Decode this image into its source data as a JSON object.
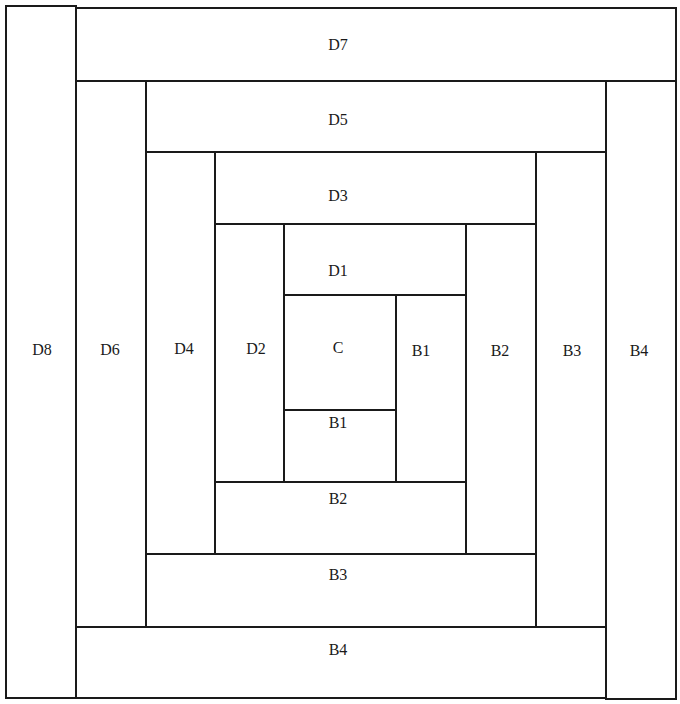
{
  "diagram": {
    "pieces": [
      {
        "id": "D8",
        "label": "D8",
        "x": 5,
        "y": 5,
        "w": 72,
        "h": 694,
        "lx": 42,
        "ly": 350
      },
      {
        "id": "D7",
        "label": "D7",
        "x": 75,
        "y": 7,
        "w": 602,
        "h": 75,
        "lx": 338,
        "ly": 45
      },
      {
        "id": "D6",
        "label": "D6",
        "x": 75,
        "y": 80,
        "w": 72,
        "h": 548,
        "lx": 110,
        "ly": 350
      },
      {
        "id": "D5",
        "label": "D5",
        "x": 145,
        "y": 80,
        "w": 462,
        "h": 73,
        "lx": 338,
        "ly": 120
      },
      {
        "id": "B4-right",
        "label": "B4",
        "x": 605,
        "y": 80,
        "w": 72,
        "h": 620,
        "lx": 639,
        "ly": 351
      },
      {
        "id": "D4",
        "label": "D4",
        "x": 145,
        "y": 151,
        "w": 71,
        "h": 404,
        "lx": 184,
        "ly": 349
      },
      {
        "id": "D3",
        "label": "D3",
        "x": 214,
        "y": 151,
        "w": 323,
        "h": 74,
        "lx": 338,
        "ly": 196
      },
      {
        "id": "B3-right",
        "label": "B3",
        "x": 535,
        "y": 151,
        "w": 72,
        "h": 477,
        "lx": 572,
        "ly": 351
      },
      {
        "id": "D2",
        "label": "D2",
        "x": 214,
        "y": 223,
        "w": 71,
        "h": 260,
        "lx": 256,
        "ly": 349
      },
      {
        "id": "D1",
        "label": "D1",
        "x": 283,
        "y": 223,
        "w": 184,
        "h": 73,
        "lx": 338,
        "ly": 271
      },
      {
        "id": "B2-right",
        "label": "B2",
        "x": 465,
        "y": 223,
        "w": 72,
        "h": 332,
        "lx": 500,
        "ly": 351
      },
      {
        "id": "C",
        "label": "C",
        "x": 283,
        "y": 294,
        "w": 114,
        "h": 117,
        "lx": 338,
        "ly": 348
      },
      {
        "id": "B1-right",
        "label": "B1",
        "x": 395,
        "y": 294,
        "w": 72,
        "h": 189,
        "lx": 421,
        "ly": 351
      },
      {
        "id": "B1-bottom",
        "label": "B1",
        "x": 283,
        "y": 409,
        "w": 114,
        "h": 74,
        "lx": 338,
        "ly": 423
      },
      {
        "id": "B2-bottom",
        "label": "B2",
        "x": 214,
        "y": 481,
        "w": 253,
        "h": 74,
        "lx": 338,
        "ly": 499
      },
      {
        "id": "B3-bottom",
        "label": "B3",
        "x": 145,
        "y": 553,
        "w": 392,
        "h": 75,
        "lx": 338,
        "ly": 575
      },
      {
        "id": "B4-bottom",
        "label": "B4",
        "x": 75,
        "y": 626,
        "w": 532,
        "h": 73,
        "lx": 338,
        "ly": 650
      }
    ]
  },
  "colors": {
    "line": "#1a1a1a",
    "fill": "#ffffff"
  }
}
